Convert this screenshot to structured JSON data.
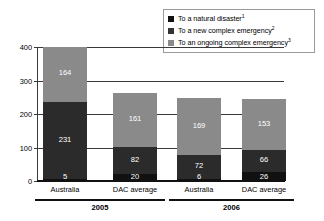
{
  "legend": {
    "position": "top-right",
    "items": [
      {
        "label": "To a natural disaster",
        "sup": "1",
        "color": "#111111",
        "name": "natural-disaster"
      },
      {
        "label": "To a new complex emergency",
        "sup": "2",
        "color": "#333333",
        "name": "new-complex-emergency"
      },
      {
        "label": "To an ongoing complex emergency",
        "sup": "3",
        "color": "#8a8a8a",
        "name": "ongoing-complex-emergency"
      }
    ]
  },
  "axis": {
    "y_ticks": [
      "0",
      "100",
      "200",
      "300",
      "400"
    ],
    "y_min": 0,
    "y_max": 400
  },
  "groups": [
    {
      "label": "2005",
      "categories": [
        "Australia",
        "DAC average"
      ]
    },
    {
      "label": "2006",
      "categories": [
        "Australia",
        "DAC average"
      ]
    }
  ],
  "bars": [
    {
      "category": "Australia",
      "group": "2005",
      "segments": [
        {
          "value": "5",
          "num": 5,
          "color": "#111111"
        },
        {
          "value": "231",
          "num": 231,
          "color": "#2b2b2b"
        },
        {
          "value": "164",
          "num": 164,
          "color": "#8a8a8a"
        }
      ],
      "total": 400
    },
    {
      "category": "DAC average",
      "group": "2005",
      "segments": [
        {
          "value": "20",
          "num": 20,
          "color": "#111111"
        },
        {
          "value": "82",
          "num": 82,
          "color": "#2b2b2b"
        },
        {
          "value": "161",
          "num": 161,
          "color": "#8a8a8a"
        }
      ],
      "total": 263
    },
    {
      "category": "Australia",
      "group": "2006",
      "segments": [
        {
          "value": "6",
          "num": 6,
          "color": "#111111"
        },
        {
          "value": "72",
          "num": 72,
          "color": "#2b2b2b"
        },
        {
          "value": "169",
          "num": 169,
          "color": "#8a8a8a"
        }
      ],
      "total": 247
    },
    {
      "category": "DAC average",
      "group": "2006",
      "segments": [
        {
          "value": "26",
          "num": 26,
          "color": "#111111"
        },
        {
          "value": "66",
          "num": 66,
          "color": "#2b2b2b"
        },
        {
          "value": "153",
          "num": 153,
          "color": "#8a8a8a"
        }
      ],
      "total": 245
    }
  ],
  "chart_data": {
    "type": "bar",
    "subtype": "stacked-vertical",
    "title": "",
    "xlabel": "",
    "ylabel": "",
    "ylim": [
      0,
      400
    ],
    "yticks": [
      0,
      100,
      200,
      300,
      400
    ],
    "grid": true,
    "legend_position": "top-right",
    "categories": [
      "Australia 2005",
      "DAC average 2005",
      "Australia 2006",
      "DAC average 2006"
    ],
    "group_labels": [
      "2005",
      "2005",
      "2006",
      "2006"
    ],
    "series": [
      {
        "name": "To a natural disaster",
        "values": [
          5,
          20,
          6,
          26
        ],
        "color": "#111111"
      },
      {
        "name": "To a new complex emergency",
        "values": [
          231,
          82,
          72,
          66
        ],
        "color": "#2b2b2b"
      },
      {
        "name": "To an ongoing complex emergency",
        "values": [
          164,
          161,
          169,
          153
        ],
        "color": "#8a8a8a"
      }
    ],
    "totals": [
      400,
      263,
      247,
      245
    ],
    "annotations": [
      "Legend footnote markers: 1, 2, 3 on the three series labels"
    ]
  }
}
